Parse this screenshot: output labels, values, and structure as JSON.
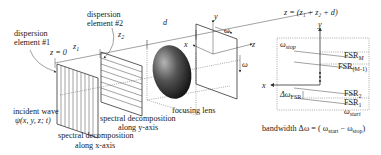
{
  "left_figure": {
    "labels": {
      "element1_line1": "dispersion",
      "element1_line2": "element #1",
      "element2_line1": "dispersion",
      "element2_line2": "element #2",
      "z0": "z = 0",
      "z1": "z",
      "z1_sub": "1",
      "z2": "z",
      "z2_sub": "2",
      "d": "d",
      "incident_line1": "incident wave",
      "incident_line2": "ψ(x, y, z; t)",
      "spec_x_line1": "spectral decomposition",
      "spec_x_line2": "along x-axis",
      "spec_y_line1": "spectral decomposition",
      "spec_y_line2": "along y-axis",
      "focusing_lens": "focusing lens",
      "axis_y": "y",
      "axis_x": "x",
      "axis_z": "z",
      "omega_top": "ω",
      "omega_side": "ω"
    }
  },
  "right_figure": {
    "title": "z = (z",
    "title_full": "z = (z₁ + z₂ + d)",
    "axis_y": "y",
    "axis_x": "x",
    "omega_stop": "ω",
    "omega_stop_sub": "stop",
    "omega_start": "ω",
    "omega_start_sub": "start",
    "fsr_M": "FSR",
    "fsr_M_sub": "M",
    "fsr_M1": "FSR",
    "fsr_M1_sub": "(M-1)",
    "fsr_2": "FSR",
    "fsr_2_sub": "2",
    "fsr_1": "FSR",
    "fsr_1_sub": "1",
    "delta_fsr": "Δω",
    "delta_fsr_sub": "FSR",
    "bandwidth": "bandwidth Δω =  ( ω",
    "bandwidth_start_sub": "start",
    "bandwidth_minus": " − ω",
    "bandwidth_stop_sub": "stop",
    "bandwidth_close": ")"
  }
}
